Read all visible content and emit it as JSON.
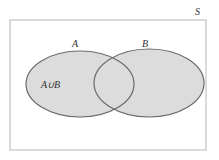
{
  "diagram": {
    "type": "venn",
    "universe_label": "S",
    "sets": [
      {
        "name": "A",
        "label": "A"
      },
      {
        "name": "B",
        "label": "B"
      }
    ],
    "region_label": "A∪B",
    "shaded_region": "union",
    "colors": {
      "fill": "#d9d9d9",
      "stroke": "#666666",
      "border": "#b0b0b0",
      "background": "#ffffff"
    }
  }
}
